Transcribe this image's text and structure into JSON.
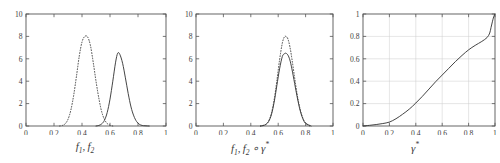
{
  "figure": {
    "type": "multi-panel-line-plot",
    "background": "#ffffff",
    "axis_color": "#555555",
    "curve_color": "#3a3a3a",
    "grid_color": "#cccccc",
    "panel_count": 3
  },
  "panels": [
    {
      "id": "panel-left",
      "xlabel_parts": {
        "f": "f",
        "one": "1",
        "comma": ", ",
        "f2": "f",
        "two": "2"
      },
      "xlabel_text": "f1, f2",
      "xticks": [
        "0",
        "0.2",
        "0.4",
        "0.6",
        "0.8",
        "1"
      ],
      "xtick_values": [
        0,
        0.2,
        0.4,
        0.6,
        0.8,
        1
      ],
      "yticks": [
        "0",
        "2",
        "4",
        "6",
        "8",
        "10"
      ],
      "ytick_values": [
        0,
        2,
        4,
        6,
        8,
        10
      ],
      "xlim": [
        0,
        1
      ],
      "ylim": [
        0,
        10
      ],
      "grid": false
    },
    {
      "id": "panel-middle",
      "xlabel_text": "f1, f2 ∘ γ*",
      "xticks": [
        "0",
        "0.2",
        "0.4",
        "0.6",
        "0.8",
        "1"
      ],
      "xtick_values": [
        0,
        0.2,
        0.4,
        0.6,
        0.8,
        1
      ],
      "yticks": [
        "0",
        "2",
        "4",
        "6",
        "8",
        "10"
      ],
      "ytick_values": [
        0,
        2,
        4,
        6,
        8,
        10
      ],
      "xlim": [
        0,
        1
      ],
      "ylim": [
        0,
        10
      ],
      "grid": false
    },
    {
      "id": "panel-right",
      "xlabel_text": "γ*",
      "xticks": [
        "0",
        "0.2",
        "0.4",
        "0.6",
        "0.8",
        "1"
      ],
      "xtick_values": [
        0,
        0.2,
        0.4,
        0.6,
        0.8,
        1
      ],
      "yticks": [
        "0",
        "0.2",
        "0.4",
        "0.6",
        "0.8",
        "1"
      ],
      "ytick_values": [
        0,
        0.2,
        0.4,
        0.6,
        0.8,
        1
      ],
      "xlim": [
        0,
        1
      ],
      "ylim": [
        0,
        1
      ],
      "grid": true
    }
  ],
  "chart_data": [
    {
      "type": "line",
      "panel": "panel-left",
      "title": "",
      "xlabel": "f1, f2",
      "ylabel": "",
      "xlim": [
        0,
        1
      ],
      "ylim": [
        0,
        10
      ],
      "xticks": [
        0,
        0.2,
        0.4,
        0.6,
        0.8,
        1
      ],
      "yticks": [
        0,
        2,
        4,
        6,
        8,
        10
      ],
      "grid": false,
      "legend": "none",
      "series": [
        {
          "name": "f2 (dotted)",
          "style": "dotted",
          "peak_x": 0.44,
          "peak_y": 8.0,
          "x": [
            0.24,
            0.26,
            0.28,
            0.3,
            0.32,
            0.34,
            0.36,
            0.38,
            0.4,
            0.42,
            0.44,
            0.46,
            0.48,
            0.5,
            0.52,
            0.54,
            0.56,
            0.58,
            0.6,
            0.62
          ],
          "values": [
            0.0,
            0.05,
            0.2,
            0.6,
            1.4,
            2.7,
            4.4,
            6.2,
            7.5,
            8.0,
            7.95,
            7.2,
            5.7,
            4.0,
            2.5,
            1.3,
            0.6,
            0.22,
            0.07,
            0.0
          ]
        },
        {
          "name": "f1 (solid)",
          "style": "solid",
          "peak_x": 0.655,
          "peak_y": 6.5,
          "x": [
            0.5,
            0.52,
            0.54,
            0.56,
            0.58,
            0.6,
            0.62,
            0.64,
            0.655,
            0.67,
            0.69,
            0.71,
            0.73,
            0.75,
            0.77,
            0.79,
            0.81,
            0.83,
            0.85,
            0.88
          ],
          "values": [
            0.0,
            0.05,
            0.18,
            0.5,
            1.2,
            2.4,
            4.0,
            5.7,
            6.5,
            6.4,
            5.6,
            4.3,
            2.9,
            1.7,
            0.9,
            0.4,
            0.15,
            0.05,
            0.02,
            0.0
          ]
        }
      ]
    },
    {
      "type": "line",
      "panel": "panel-middle",
      "title": "",
      "xlabel": "f1, f2 ∘ γ*",
      "ylabel": "",
      "xlim": [
        0,
        1
      ],
      "ylim": [
        0,
        10
      ],
      "xticks": [
        0,
        0.2,
        0.4,
        0.6,
        0.8,
        1
      ],
      "yticks": [
        0,
        2,
        4,
        6,
        8,
        10
      ],
      "grid": false,
      "legend": "none",
      "series": [
        {
          "name": "f2 warped (dotted)",
          "style": "dotted",
          "peak_x": 0.655,
          "peak_y": 8.0,
          "x": [
            0.47,
            0.49,
            0.51,
            0.53,
            0.55,
            0.57,
            0.59,
            0.61,
            0.63,
            0.645,
            0.655,
            0.67,
            0.685,
            0.7,
            0.72,
            0.74,
            0.76,
            0.78,
            0.8,
            0.83
          ],
          "values": [
            0.0,
            0.05,
            0.15,
            0.45,
            1.1,
            2.3,
            4.0,
            5.9,
            7.4,
            7.95,
            8.0,
            7.8,
            7.1,
            6.0,
            4.3,
            2.7,
            1.5,
            0.7,
            0.25,
            0.0
          ]
        },
        {
          "name": "f1 (solid)",
          "style": "solid",
          "peak_x": 0.655,
          "peak_y": 6.5,
          "x": [
            0.47,
            0.49,
            0.51,
            0.53,
            0.55,
            0.57,
            0.59,
            0.61,
            0.63,
            0.645,
            0.655,
            0.67,
            0.685,
            0.7,
            0.72,
            0.74,
            0.76,
            0.78,
            0.8,
            0.84
          ],
          "values": [
            0.0,
            0.04,
            0.14,
            0.4,
            1.0,
            2.1,
            3.6,
            5.1,
            6.2,
            6.45,
            6.5,
            6.35,
            5.9,
            5.1,
            3.8,
            2.5,
            1.4,
            0.65,
            0.25,
            0.0
          ]
        }
      ]
    },
    {
      "type": "line",
      "panel": "panel-right",
      "title": "",
      "xlabel": "γ*",
      "ylabel": "",
      "xlim": [
        0,
        1
      ],
      "ylim": [
        0,
        1
      ],
      "xticks": [
        0,
        0.2,
        0.4,
        0.6,
        0.8,
        1
      ],
      "yticks": [
        0,
        0.2,
        0.4,
        0.6,
        0.8,
        1
      ],
      "grid": true,
      "legend": "none",
      "series": [
        {
          "name": "warping function γ*",
          "style": "solid",
          "x": [
            0.0,
            0.05,
            0.1,
            0.15,
            0.2,
            0.25,
            0.3,
            0.35,
            0.4,
            0.45,
            0.5,
            0.55,
            0.6,
            0.65,
            0.7,
            0.75,
            0.8,
            0.85,
            0.9,
            0.94,
            0.96,
            0.97,
            0.98,
            0.99,
            1.0
          ],
          "values": [
            0.0,
            0.006,
            0.013,
            0.022,
            0.035,
            0.065,
            0.105,
            0.15,
            0.205,
            0.265,
            0.33,
            0.395,
            0.455,
            0.515,
            0.575,
            0.63,
            0.68,
            0.72,
            0.755,
            0.79,
            0.83,
            0.88,
            0.93,
            0.975,
            1.0
          ]
        }
      ]
    }
  ]
}
